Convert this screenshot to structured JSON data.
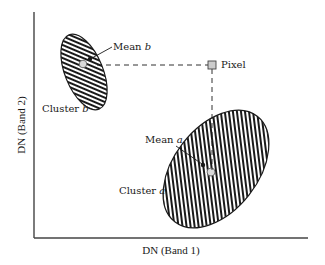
{
  "diagram": {
    "type": "feature-space-scatter",
    "axes": {
      "x_label": "DN (Band 1)",
      "y_label": "DN (Band 2)"
    },
    "clusters": [
      {
        "id": "b",
        "label_prefix": "Cluster ",
        "label_var": "b",
        "mean_label_prefix": "Mean ",
        "mean_label_var": "b",
        "fill_pattern": "diagonal-hatch"
      },
      {
        "id": "a",
        "label_prefix": "Cluster ",
        "label_var": "a",
        "mean_label_prefix": "Mean ",
        "mean_label_var": "a",
        "fill_pattern": "diagonal-hatch"
      }
    ],
    "pixel": {
      "label": "Pixel",
      "color": "#cccccc"
    },
    "colors": {
      "ink": "#1a1a1a",
      "hatch_bg": "#ffffff",
      "mean_marker": "#d9d9d9",
      "pixel_fill": "#cccccc"
    }
  }
}
